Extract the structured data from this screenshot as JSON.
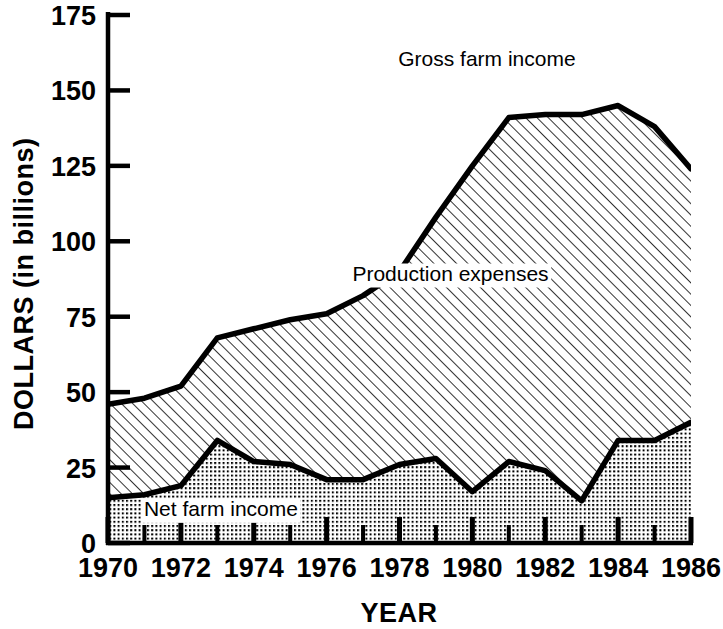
{
  "chart_data": {
    "type": "area",
    "title": "",
    "xlabel": "YEAR",
    "ylabel": "DOLLARS (in billions)",
    "xlim": [
      1970,
      1986
    ],
    "ylim": [
      0,
      175
    ],
    "grid": false,
    "stacked": true,
    "legend_position": "in-plot-annotations",
    "x": [
      1970,
      1971,
      1972,
      1973,
      1974,
      1975,
      1976,
      1977,
      1978,
      1979,
      1980,
      1981,
      1982,
      1983,
      1984,
      1985,
      1986
    ],
    "x_tick_labels": [
      "1970",
      "1972",
      "1974",
      "1976",
      "1978",
      "1980",
      "1982",
      "1984",
      "1986"
    ],
    "x_tick_values": [
      1970,
      1972,
      1974,
      1976,
      1978,
      1980,
      1982,
      1984,
      1986
    ],
    "x_minor_ticks_every": 1,
    "y_tick_labels": [
      "0",
      "25",
      "50",
      "75",
      "100",
      "125",
      "150",
      "175"
    ],
    "y_tick_values": [
      0,
      25,
      50,
      75,
      100,
      125,
      150,
      175
    ],
    "series": [
      {
        "name": "Gross farm income",
        "fill": "diagonal-hatch",
        "values": [
          46,
          48,
          52,
          68,
          71,
          74,
          76,
          82,
          90,
          108,
          125,
          141,
          142,
          142,
          145,
          138,
          124
        ]
      },
      {
        "name": "Net farm income",
        "fill": "dot-stipple",
        "values": [
          15,
          16,
          19,
          34,
          27,
          26,
          21,
          21,
          26,
          28,
          17,
          27,
          24,
          14,
          34,
          34,
          40
        ]
      }
    ],
    "annotations": [
      {
        "text": "Gross farm income",
        "x": 1980.4,
        "y": 158
      },
      {
        "text": "Production expenses",
        "x": 1979.4,
        "y": 87
      },
      {
        "text": "Net farm income",
        "x": 1973.1,
        "y": 9
      }
    ]
  },
  "axes": {
    "y_axis_title": "DOLLARS (in billions)",
    "x_axis_title": "YEAR"
  },
  "colors": {
    "line": "#000000",
    "background": "#ffffff",
    "pattern": "#000000"
  }
}
